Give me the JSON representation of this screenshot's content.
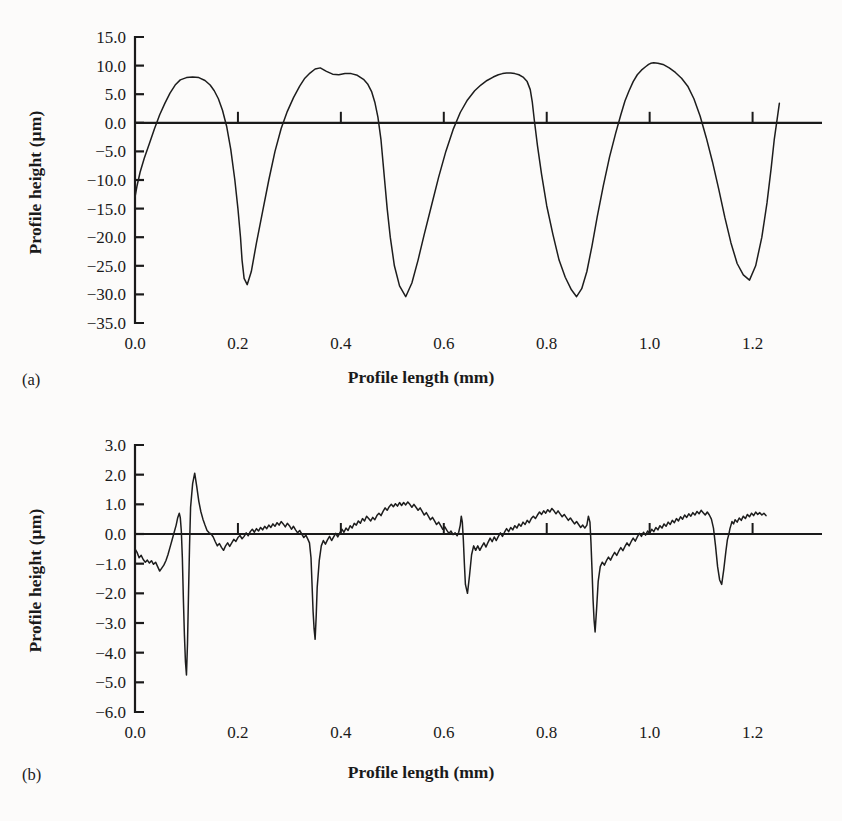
{
  "figure": {
    "background_color": "#fcfbfa",
    "line_color": "#1d1d1d",
    "axis_color": "#1a1a1a"
  },
  "panels": [
    {
      "tag": "(a)",
      "xlabel": "Profile length (mm)",
      "ylabel": "Profile height (µm)",
      "ylabel_plain": "Profile height (um)"
    },
    {
      "tag": "(b)",
      "xlabel": "Profile length (mm)",
      "ylabel": "Profile height (µm)",
      "ylabel_plain": "Profile height (um)"
    }
  ],
  "chart_data": [
    {
      "type": "line",
      "title": "",
      "panel": "(a)",
      "xlabel": "Profile length (mm)",
      "ylabel": "Profile height (µm)",
      "xlim": [
        0.0,
        1.2727
      ],
      "ylim": [
        -35.0,
        15.0
      ],
      "xticks": [
        0.0,
        0.2,
        0.4,
        0.6,
        0.8,
        1.0,
        1.2
      ],
      "xtick_labels": [
        "0.0",
        "0.2",
        "0.4",
        "0.6",
        "0.8",
        "1.0",
        "1.2"
      ],
      "yticks": [
        15.0,
        10.0,
        5.0,
        0.0,
        -5.0,
        -10.0,
        -15.0,
        -20.0,
        -25.0,
        -30.0,
        -35.0
      ],
      "ytick_labels": [
        "15.0",
        "10.0",
        "5.0",
        "0.0",
        "−5.0",
        "−10.0",
        "−15.0",
        "−20.0",
        "−25.0",
        "−30.0",
        "−35.0"
      ],
      "grid": false,
      "legend": "none",
      "zero_line": true,
      "series": [
        {
          "name": "ground surface profile",
          "x": [
            0.0,
            0.004,
            0.01,
            0.018,
            0.028,
            0.038,
            0.048,
            0.058,
            0.068,
            0.078,
            0.088,
            0.1,
            0.112,
            0.124,
            0.136,
            0.146,
            0.154,
            0.162,
            0.17,
            0.178,
            0.186,
            0.194,
            0.2,
            0.205,
            0.208,
            0.212,
            0.218,
            0.226,
            0.236,
            0.248,
            0.26,
            0.272,
            0.284,
            0.296,
            0.308,
            0.32,
            0.33,
            0.34,
            0.35,
            0.36,
            0.372,
            0.384,
            0.396,
            0.408,
            0.42,
            0.432,
            0.444,
            0.452,
            0.46,
            0.466,
            0.472,
            0.478,
            0.482,
            0.486,
            0.49,
            0.496,
            0.504,
            0.514,
            0.526,
            0.538,
            0.55,
            0.562,
            0.576,
            0.59,
            0.604,
            0.618,
            0.632,
            0.646,
            0.66,
            0.672,
            0.684,
            0.696,
            0.706,
            0.714,
            0.722,
            0.73,
            0.738,
            0.746,
            0.754,
            0.762,
            0.768,
            0.772,
            0.776,
            0.782,
            0.79,
            0.8,
            0.812,
            0.824,
            0.836,
            0.848,
            0.858,
            0.868,
            0.878,
            0.888,
            0.898,
            0.91,
            0.922,
            0.934,
            0.944,
            0.952,
            0.96,
            0.968,
            0.976,
            0.984,
            0.992,
            0.998,
            1.002,
            1.008,
            1.016,
            1.026,
            1.038,
            1.05,
            1.062,
            1.074,
            1.086,
            1.098,
            1.11,
            1.122,
            1.134,
            1.146,
            1.158,
            1.17,
            1.182,
            1.194,
            1.206,
            1.218,
            1.228,
            1.236,
            1.242,
            1.248,
            1.252
          ],
          "y": [
            -13.0,
            -11.0,
            -8.6,
            -6.2,
            -3.6,
            -1.0,
            1.4,
            3.4,
            5.2,
            6.6,
            7.5,
            7.9,
            8.0,
            7.9,
            7.4,
            6.6,
            5.6,
            4.2,
            2.2,
            -0.6,
            -4.6,
            -10.0,
            -15.0,
            -20.0,
            -24.0,
            -27.2,
            -28.3,
            -26.0,
            -21.0,
            -15.5,
            -10.0,
            -5.0,
            -1.0,
            2.0,
            4.4,
            6.4,
            7.8,
            8.7,
            9.4,
            9.6,
            9.0,
            8.5,
            8.4,
            8.6,
            8.6,
            8.3,
            7.6,
            6.8,
            5.4,
            3.6,
            1.0,
            -3.0,
            -7.0,
            -11.0,
            -15.0,
            -20.0,
            -25.0,
            -28.5,
            -30.4,
            -28.0,
            -24.0,
            -19.5,
            -14.5,
            -9.5,
            -5.0,
            -1.2,
            1.8,
            4.0,
            5.6,
            6.6,
            7.4,
            8.0,
            8.4,
            8.6,
            8.7,
            8.7,
            8.6,
            8.4,
            8.0,
            7.2,
            5.8,
            3.6,
            0.4,
            -4.0,
            -9.0,
            -14.5,
            -19.5,
            -24.0,
            -27.0,
            -29.2,
            -30.4,
            -29.0,
            -26.0,
            -21.5,
            -16.5,
            -11.0,
            -6.0,
            -1.8,
            1.4,
            3.8,
            5.6,
            7.2,
            8.4,
            9.2,
            9.8,
            10.2,
            10.4,
            10.5,
            10.4,
            10.2,
            9.6,
            8.8,
            7.8,
            6.4,
            4.2,
            1.2,
            -2.6,
            -6.8,
            -11.5,
            -16.5,
            -21.0,
            -24.6,
            -26.6,
            -27.5,
            -25.0,
            -20.0,
            -14.0,
            -8.0,
            -3.0,
            0.8,
            3.4,
            5.2,
            6.6,
            7.6,
            8.4,
            8.8,
            9.0,
            9.0,
            8.6,
            7.0,
            3.0,
            -2.0,
            -5.4,
            -6.2
          ]
        }
      ]
    },
    {
      "type": "line",
      "title": "",
      "panel": "(b)",
      "xlabel": "Profile length (mm)",
      "ylabel": "Profile height (µm)",
      "xlim": [
        0.0,
        1.2727
      ],
      "ylim": [
        -6.0,
        3.0
      ],
      "xticks": [
        0.0,
        0.2,
        0.4,
        0.6,
        0.8,
        1.0,
        1.2
      ],
      "xtick_labels": [
        "0.0",
        "0.2",
        "0.4",
        "0.6",
        "0.8",
        "1.0",
        "1.2"
      ],
      "yticks": [
        3.0,
        2.0,
        1.0,
        0.0,
        -1.0,
        -2.0,
        -3.0,
        -4.0,
        -5.0,
        -6.0
      ],
      "ytick_labels": [
        "3.0",
        "2.0",
        "1.0",
        "0.0",
        "−1.0",
        "−2.0",
        "−3.0",
        "−4.0",
        "−5.0",
        "−6.0"
      ],
      "grid": false,
      "legend": "none",
      "zero_line": true,
      "series": [
        {
          "name": "polished surface profile",
          "x": [
            0.0,
            0.004,
            0.008,
            0.012,
            0.016,
            0.02,
            0.024,
            0.028,
            0.032,
            0.036,
            0.04,
            0.044,
            0.048,
            0.052,
            0.056,
            0.06,
            0.064,
            0.068,
            0.072,
            0.076,
            0.08,
            0.083,
            0.086,
            0.088,
            0.09,
            0.092,
            0.094,
            0.096,
            0.098,
            0.1,
            0.102,
            0.104,
            0.106,
            0.108,
            0.112,
            0.116,
            0.12,
            0.124,
            0.128,
            0.132,
            0.136,
            0.14,
            0.144,
            0.148,
            0.152,
            0.156,
            0.16,
            0.164,
            0.168,
            0.172,
            0.176,
            0.18,
            0.184,
            0.188,
            0.192,
            0.196,
            0.2,
            0.204,
            0.208,
            0.212,
            0.216,
            0.22,
            0.224,
            0.228,
            0.232,
            0.236,
            0.24,
            0.244,
            0.248,
            0.252,
            0.256,
            0.26,
            0.264,
            0.268,
            0.272,
            0.276,
            0.28,
            0.284,
            0.288,
            0.292,
            0.296,
            0.3,
            0.304,
            0.308,
            0.312,
            0.316,
            0.32,
            0.324,
            0.328,
            0.332,
            0.336,
            0.339,
            0.342,
            0.344,
            0.346,
            0.348,
            0.35,
            0.352,
            0.354,
            0.358,
            0.362,
            0.366,
            0.37,
            0.374,
            0.378,
            0.382,
            0.386,
            0.39,
            0.394,
            0.398,
            0.402,
            0.406,
            0.41,
            0.414,
            0.418,
            0.422,
            0.426,
            0.43,
            0.434,
            0.438,
            0.442,
            0.446,
            0.45,
            0.454,
            0.458,
            0.462,
            0.466,
            0.47,
            0.474,
            0.478,
            0.482,
            0.486,
            0.49,
            0.494,
            0.498,
            0.502,
            0.506,
            0.51,
            0.514,
            0.518,
            0.522,
            0.526,
            0.53,
            0.534,
            0.538,
            0.542,
            0.546,
            0.55,
            0.554,
            0.558,
            0.562,
            0.566,
            0.57,
            0.574,
            0.578,
            0.582,
            0.586,
            0.59,
            0.594,
            0.598,
            0.602,
            0.606,
            0.61,
            0.614,
            0.618,
            0.622,
            0.626,
            0.629,
            0.632,
            0.634,
            0.636,
            0.638,
            0.64,
            0.642,
            0.646,
            0.65,
            0.654,
            0.658,
            0.662,
            0.666,
            0.67,
            0.674,
            0.678,
            0.682,
            0.686,
            0.69,
            0.694,
            0.698,
            0.702,
            0.706,
            0.71,
            0.714,
            0.718,
            0.722,
            0.726,
            0.73,
            0.734,
            0.738,
            0.742,
            0.746,
            0.75,
            0.754,
            0.758,
            0.762,
            0.766,
            0.77,
            0.774,
            0.778,
            0.782,
            0.786,
            0.79,
            0.794,
            0.798,
            0.802,
            0.806,
            0.81,
            0.814,
            0.818,
            0.822,
            0.826,
            0.83,
            0.834,
            0.838,
            0.842,
            0.846,
            0.85,
            0.854,
            0.858,
            0.862,
            0.866,
            0.87,
            0.874,
            0.878,
            0.881,
            0.884,
            0.886,
            0.888,
            0.89,
            0.892,
            0.894,
            0.897,
            0.9,
            0.904,
            0.908,
            0.912,
            0.916,
            0.92,
            0.924,
            0.928,
            0.932,
            0.936,
            0.94,
            0.944,
            0.948,
            0.952,
            0.956,
            0.96,
            0.964,
            0.968,
            0.972,
            0.976,
            0.98,
            0.984,
            0.988,
            0.992,
            0.996,
            1.0,
            1.004,
            1.008,
            1.012,
            1.016,
            1.02,
            1.024,
            1.028,
            1.032,
            1.036,
            1.04,
            1.044,
            1.048,
            1.052,
            1.056,
            1.06,
            1.064,
            1.068,
            1.072,
            1.076,
            1.08,
            1.084,
            1.088,
            1.092,
            1.096,
            1.1,
            1.104,
            1.108,
            1.112,
            1.116,
            1.12,
            1.124,
            1.128,
            1.132,
            1.136,
            1.14,
            1.144,
            1.148,
            1.151,
            1.154,
            1.156,
            1.158,
            1.16,
            1.163,
            1.166,
            1.17,
            1.174,
            1.178,
            1.182,
            1.186,
            1.19,
            1.194,
            1.198,
            1.202,
            1.206,
            1.21,
            1.214,
            1.218,
            1.222,
            1.226,
            1.23,
            1.234,
            1.238,
            1.242,
            1.246,
            1.25
          ],
          "y": [
            -0.5,
            -0.62,
            -0.8,
            -0.72,
            -0.86,
            -0.95,
            -0.88,
            -0.98,
            -0.9,
            -1.02,
            -0.95,
            -1.1,
            -1.25,
            -1.15,
            -1.05,
            -0.9,
            -0.7,
            -0.45,
            -0.2,
            0.05,
            0.3,
            0.55,
            0.7,
            0.55,
            0.1,
            -0.8,
            -2.2,
            -3.4,
            -4.3,
            -4.75,
            -3.7,
            -2.0,
            -0.4,
            0.9,
            1.7,
            2.05,
            1.6,
            1.1,
            0.75,
            0.5,
            0.3,
            0.12,
            0.04,
            0.0,
            -0.1,
            -0.26,
            -0.4,
            -0.32,
            -0.45,
            -0.55,
            -0.4,
            -0.3,
            -0.42,
            -0.3,
            -0.18,
            -0.25,
            -0.12,
            -0.05,
            -0.16,
            -0.08,
            0.04,
            -0.06,
            0.08,
            0.16,
            0.06,
            0.18,
            0.1,
            0.22,
            0.14,
            0.26,
            0.18,
            0.3,
            0.22,
            0.34,
            0.26,
            0.38,
            0.3,
            0.42,
            0.34,
            0.24,
            0.36,
            0.28,
            0.16,
            0.26,
            0.14,
            0.04,
            0.12,
            0.0,
            -0.12,
            -0.04,
            -0.18,
            -0.3,
            -0.8,
            -1.7,
            -2.6,
            -3.2,
            -3.55,
            -2.8,
            -1.8,
            -0.9,
            -0.4,
            -0.22,
            -0.34,
            -0.2,
            -0.08,
            -0.22,
            -0.1,
            0.02,
            -0.1,
            0.04,
            0.16,
            0.06,
            0.2,
            0.12,
            0.28,
            0.2,
            0.36,
            0.3,
            0.44,
            0.36,
            0.52,
            0.44,
            0.6,
            0.52,
            0.44,
            0.56,
            0.48,
            0.62,
            0.7,
            0.62,
            0.76,
            0.88,
            0.8,
            0.92,
            1.0,
            0.92,
            1.02,
            0.94,
            1.06,
            0.96,
            1.06,
            0.98,
            1.08,
            1.0,
            0.9,
            1.0,
            0.9,
            0.8,
            0.88,
            0.76,
            0.64,
            0.72,
            0.6,
            0.48,
            0.56,
            0.44,
            0.32,
            0.4,
            0.28,
            0.16,
            0.24,
            0.12,
            0.02,
            0.1,
            -0.02,
            0.04,
            -0.06,
            0.06,
            0.3,
            0.6,
            0.4,
            -0.2,
            -1.0,
            -1.7,
            -2.0,
            -1.4,
            -0.7,
            -0.4,
            -0.55,
            -0.4,
            -0.55,
            -0.42,
            -0.3,
            -0.44,
            -0.28,
            -0.14,
            -0.26,
            -0.1,
            -0.22,
            -0.08,
            0.04,
            -0.08,
            0.06,
            0.18,
            0.08,
            0.22,
            0.14,
            0.28,
            0.2,
            0.34,
            0.26,
            0.4,
            0.32,
            0.46,
            0.38,
            0.52,
            0.6,
            0.52,
            0.64,
            0.74,
            0.66,
            0.78,
            0.7,
            0.82,
            0.74,
            0.86,
            0.78,
            0.68,
            0.78,
            0.68,
            0.58,
            0.66,
            0.56,
            0.46,
            0.54,
            0.44,
            0.34,
            0.42,
            0.32,
            0.22,
            0.3,
            0.2,
            0.3,
            0.6,
            0.4,
            -0.3,
            -1.2,
            -2.2,
            -2.9,
            -3.3,
            -2.5,
            -1.6,
            -1.1,
            -0.95,
            -1.05,
            -0.9,
            -0.78,
            -0.88,
            -0.74,
            -0.62,
            -0.72,
            -0.58,
            -0.46,
            -0.56,
            -0.42,
            -0.3,
            -0.4,
            -0.26,
            -0.14,
            -0.24,
            -0.1,
            0.02,
            -0.08,
            0.06,
            -0.04,
            0.1,
            0.02,
            0.16,
            0.08,
            0.22,
            0.14,
            0.28,
            0.2,
            0.34,
            0.26,
            0.4,
            0.32,
            0.46,
            0.38,
            0.52,
            0.44,
            0.58,
            0.5,
            0.64,
            0.56,
            0.68,
            0.6,
            0.72,
            0.64,
            0.76,
            0.68,
            0.8,
            0.72,
            0.64,
            0.74,
            0.64,
            0.5,
            0.2,
            -0.4,
            -1.1,
            -1.55,
            -1.7,
            -1.2,
            -0.6,
            -0.2,
            0.0,
            0.18,
            0.3,
            0.42,
            0.34,
            0.48,
            0.4,
            0.54,
            0.46,
            0.6,
            0.52,
            0.66,
            0.58,
            0.7,
            0.62,
            0.74,
            0.66,
            0.72,
            0.64,
            0.7,
            0.62
          ]
        }
      ]
    }
  ]
}
